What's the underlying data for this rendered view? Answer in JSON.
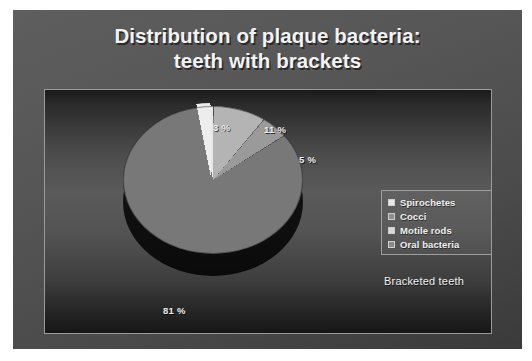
{
  "slide": {
    "title_line1": "Distribution of plaque bacteria:",
    "title_line2": "teeth with brackets",
    "caption": "Bracketed teeth",
    "background_color": "#565656",
    "title_color": "#f2f2f2"
  },
  "legend": {
    "items": [
      {
        "label": "Spirochetes",
        "color": "#e8e8e8"
      },
      {
        "label": "Cocci",
        "color": "#b4b4b4"
      },
      {
        "label": "Motile rods",
        "color": "#9a9a9a"
      },
      {
        "label": "Oral bacteria",
        "color": "#787878"
      }
    ]
  },
  "chart_data": {
    "type": "pie",
    "title": "Distribution of plaque bacteria: teeth with brackets",
    "subtitle": "Bracketed teeth",
    "categories": [
      "Spirochetes",
      "Cocci",
      "Motile rods",
      "Oral bacteria"
    ],
    "values": [
      3,
      11,
      5,
      81
    ],
    "value_unit": "%",
    "data_labels": [
      "3 %",
      "11 %",
      "5 %",
      "81 %"
    ],
    "colors": [
      "#e8e8e8",
      "#b4b4b4",
      "#9a9a9a",
      "#787878"
    ],
    "exploded_slices": [
      "Spirochetes"
    ],
    "three_d": true,
    "legend_position": "right",
    "grid": false,
    "xlabel": "",
    "ylabel": ""
  }
}
